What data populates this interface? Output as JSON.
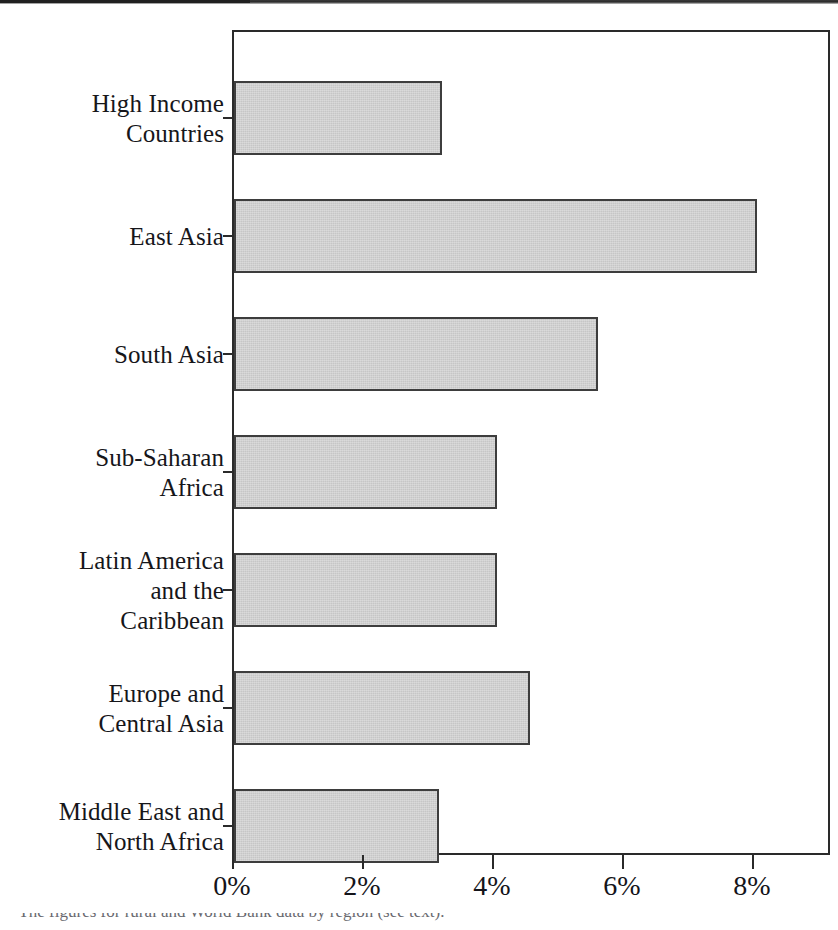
{
  "chart_data": {
    "type": "bar",
    "orientation": "horizontal",
    "title": "",
    "subtitle": "",
    "xlabel": "",
    "ylabel": "",
    "categories": [
      "High Income\nCountries",
      "East Asia",
      "South Asia",
      "Sub-Saharan\nAfrica",
      "Latin America\nand the\nCaribbean",
      "Europe and\nCentral Asia",
      "Middle East and\nNorth Africa"
    ],
    "values": [
      3.2,
      8.05,
      5.6,
      4.05,
      4.05,
      4.55,
      3.15
    ],
    "value_unit": "%",
    "xlim": [
      0,
      9.2
    ],
    "xticks": [
      0,
      2,
      4,
      6,
      8
    ],
    "xticklabels": [
      "0%",
      "2%",
      "4%",
      "6%",
      "8%"
    ],
    "grid": false,
    "legend": null,
    "bar_fill_color": "#c6c6c6",
    "bar_edge_color": "#3d3d3d",
    "frame_color": "#2a2a2a",
    "background_color": "#ffffff"
  },
  "figure": {
    "footnote": "* The figures for rural and World Bank data by region (see text)."
  }
}
